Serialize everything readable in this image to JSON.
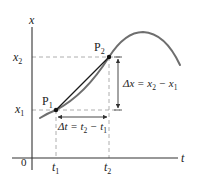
{
  "diagram": {
    "axes": {
      "y_label": "x",
      "x_label": "t",
      "origin_label": "0"
    },
    "points": [
      {
        "name": "P",
        "sub": "1"
      },
      {
        "name": "P",
        "sub": "2"
      }
    ],
    "y_ticks": [
      {
        "var": "x",
        "sub": "2"
      },
      {
        "var": "x",
        "sub": "1"
      }
    ],
    "x_ticks": [
      {
        "var": "t",
        "sub": "1"
      },
      {
        "var": "t",
        "sub": "2"
      }
    ],
    "delta_x": {
      "prefix": "Δx = x",
      "sub_a": "2",
      "minus": " − x",
      "sub_b": "1"
    },
    "delta_t": {
      "prefix": "Δt = t",
      "sub_a": "2",
      "minus": " − t",
      "sub_b": "1"
    },
    "colors": {
      "curve": "#6e6e6e",
      "chord": "#1a1a1a",
      "axis": "#333333",
      "dashed": "#9a9a9a",
      "text": "#222222"
    }
  }
}
